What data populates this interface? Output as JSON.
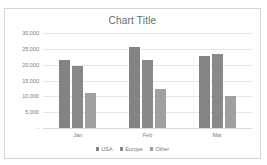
{
  "chart_data": {
    "type": "bar",
    "title": "Chart Title",
    "xlabel": "",
    "ylabel": "",
    "categories": [
      "Jan",
      "Feb",
      "Mar"
    ],
    "series": [
      {
        "name": "USA",
        "values": [
          21400,
          25500,
          22700
        ],
        "color": "#838383"
      },
      {
        "name": "Europe",
        "values": [
          19600,
          21400,
          23400
        ],
        "color": "#898989"
      },
      {
        "name": "Other",
        "values": [
          11000,
          12200,
          10000
        ],
        "color": "#a0a0a0"
      }
    ],
    "ylim": [
      0,
      30000
    ],
    "yticks": [
      0,
      5000,
      10000,
      15000,
      20000,
      25000,
      30000
    ],
    "ytick_labels": [
      "-",
      "5,000",
      "10,000",
      "15,000",
      "20,000",
      "25,000",
      "30,000"
    ],
    "grid": true,
    "legend_position": "bottom"
  },
  "axis": {
    "y": {
      "t0": "-",
      "t1": "5,000",
      "t2": "10,000",
      "t3": "15,000",
      "t4": "20,000",
      "t5": "25,000",
      "t6": "30,000"
    },
    "x": {
      "c0": "Jan",
      "c1": "Feb",
      "c2": "Mar"
    }
  },
  "legend": {
    "items": [
      {
        "label": "USA"
      },
      {
        "label": "Europe"
      },
      {
        "label": "Other"
      }
    ]
  },
  "colors": {
    "series_usa": "#838383",
    "series_europe": "#898989",
    "series_other": "#a0a0a0",
    "gridline": "#e6e6e6",
    "text": "#7a7a7a",
    "border": "#d4d4d4"
  }
}
